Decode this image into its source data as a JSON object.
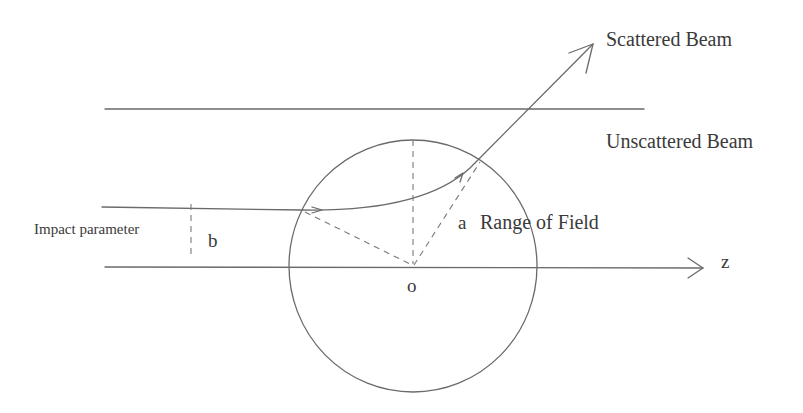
{
  "diagram": {
    "type": "scattering-geometry",
    "labels": {
      "scattered_beam": "Scattered Beam",
      "unscattered_beam": "Unscattered Beam",
      "impact_parameter": "Impact parameter",
      "b": "b",
      "a": "a",
      "range_of_field": "Range of Field",
      "origin": "o",
      "axis": "z"
    },
    "colors": {
      "stroke": "#6a6a6a",
      "dashed": "#7a7a7a",
      "text": "#3a3a3a",
      "background": "#ffffff"
    },
    "geometry": {
      "circle": {
        "cx": 413,
        "cy": 266,
        "rx": 124,
        "ry": 126
      },
      "origin": {
        "x": 413,
        "y": 266
      },
      "z_axis": {
        "x1": 105,
        "y": 267,
        "x2": 703
      },
      "unscattered_line": {
        "x1": 105,
        "y": 109,
        "x2": 644
      },
      "incoming_beam": {
        "x1": 102,
        "y1": 207,
        "x2": 302,
        "y2": 210
      },
      "trajectory_exit": {
        "x": 480,
        "y": 160
      },
      "scattered_tip": {
        "x": 593,
        "y": 44
      }
    }
  }
}
